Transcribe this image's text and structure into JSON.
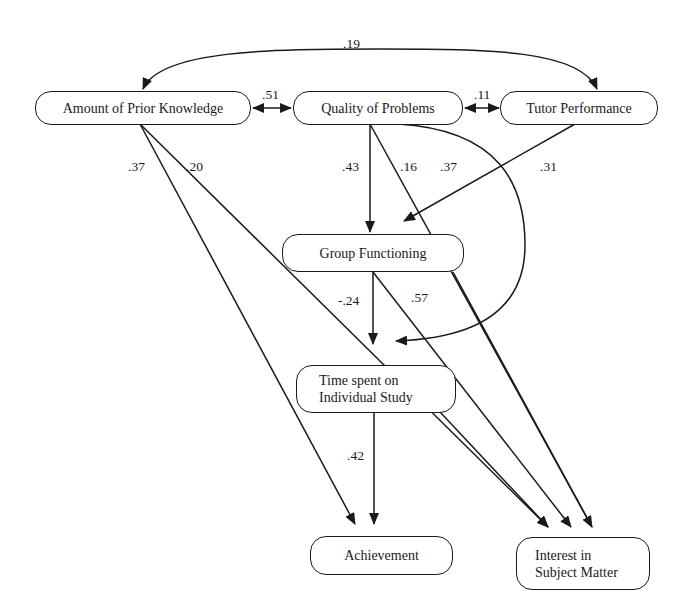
{
  "diagram": {
    "type": "path-analysis",
    "nodes": {
      "prior_knowledge": "Amount of Prior Knowledge",
      "quality_problems": "Quality of Problems",
      "tutor_performance": "Tutor Performance",
      "group_functioning": "Group Functioning",
      "time_study_line1": "Time spent on",
      "time_study_line2": "Individual Study",
      "achievement": "Achievement",
      "interest_line1": "Interest in",
      "interest_line2": "Subject Matter"
    },
    "edges": [
      {
        "from": "Amount of Prior Knowledge",
        "to": "Tutor Performance",
        "coef": ".19",
        "kind": "correlation"
      },
      {
        "from": "Amount of Prior Knowledge",
        "to": "Quality of Problems",
        "coef": ".51",
        "kind": "correlation"
      },
      {
        "from": "Quality of Problems",
        "to": "Tutor Performance",
        "coef": ".11",
        "kind": "correlation"
      },
      {
        "from": "Amount of Prior Knowledge",
        "to": "Achievement",
        "coef": ".37",
        "kind": "path"
      },
      {
        "from": "Amount of Prior Knowledge",
        "to": "Interest in Subject Matter",
        "coef": ".20",
        "kind": "path"
      },
      {
        "from": "Quality of Problems",
        "to": "Group Functioning",
        "coef": ".43",
        "kind": "path"
      },
      {
        "from": "Quality of Problems",
        "to": "Interest in Subject Matter",
        "coef": ".16",
        "kind": "path"
      },
      {
        "from": "Quality of Problems",
        "to": "Time spent on Individual Study",
        "coef": ".37",
        "kind": "path"
      },
      {
        "from": "Tutor Performance",
        "to": "Group Functioning",
        "coef": ".31",
        "kind": "path"
      },
      {
        "from": "Group Functioning",
        "to": "Time spent on Individual Study",
        "coef": "-.24",
        "kind": "path"
      },
      {
        "from": "Group Functioning",
        "to": "Interest in Subject Matter",
        "coef": ".57",
        "kind": "path"
      },
      {
        "from": "Time spent on Individual Study",
        "to": "Achievement",
        "coef": ".42",
        "kind": "path"
      },
      {
        "from": "Time spent on Individual Study",
        "to": "Interest in Subject Matter",
        "coef": "",
        "kind": "path"
      }
    ],
    "labels": {
      "c19": ".19",
      "c51": ".51",
      "c11": ".11",
      "c37a": ".37",
      "c20": ".20",
      "c43": ".43",
      "c16": ".16",
      "c37b": ".37",
      "c31": ".31",
      "cm24": "-.24",
      "c57": ".57",
      "c42": ".42"
    },
    "colors": {
      "stroke": "#1a1a1a",
      "background": "#ffffff"
    }
  }
}
